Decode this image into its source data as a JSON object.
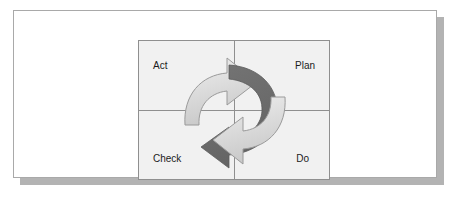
{
  "diagram": {
    "type": "cycle-diagram",
    "quadrants": [
      {
        "id": "act",
        "label": "Act",
        "position": "top-left"
      },
      {
        "id": "plan",
        "label": "Plan",
        "position": "top-right"
      },
      {
        "id": "check",
        "label": "Check",
        "position": "bottom-left"
      },
      {
        "id": "do",
        "label": "Do",
        "position": "bottom-right"
      }
    ],
    "arrows": [
      {
        "id": "upper-arrow",
        "name": "check-to-plan-arrow",
        "color": "#dcdcdc",
        "stroke": "#9a9a9a",
        "direction": "clockwise",
        "points_to": "Plan"
      },
      {
        "id": "dark-arrow",
        "name": "plan-to-check-arrow",
        "color": "#6e6e6e",
        "stroke": "#5a5a5a",
        "direction": "clockwise",
        "points_to": "Check"
      },
      {
        "id": "lower-arrow",
        "name": "do-to-act-arrow",
        "color": "#dcdcdc",
        "stroke": "#9a9a9a",
        "direction": "clockwise",
        "points_to": "Act"
      }
    ],
    "colors": {
      "card_background": "#ffffff",
      "card_border": "#a9a9a9",
      "card_shadow": "#b3b3b3",
      "panel_background": "#f1f1f1",
      "grid_line": "#8f8f8f",
      "arrow_light": "#dcdcdc",
      "arrow_dark": "#6e6e6e",
      "label_text": "#1b1b1b"
    }
  }
}
